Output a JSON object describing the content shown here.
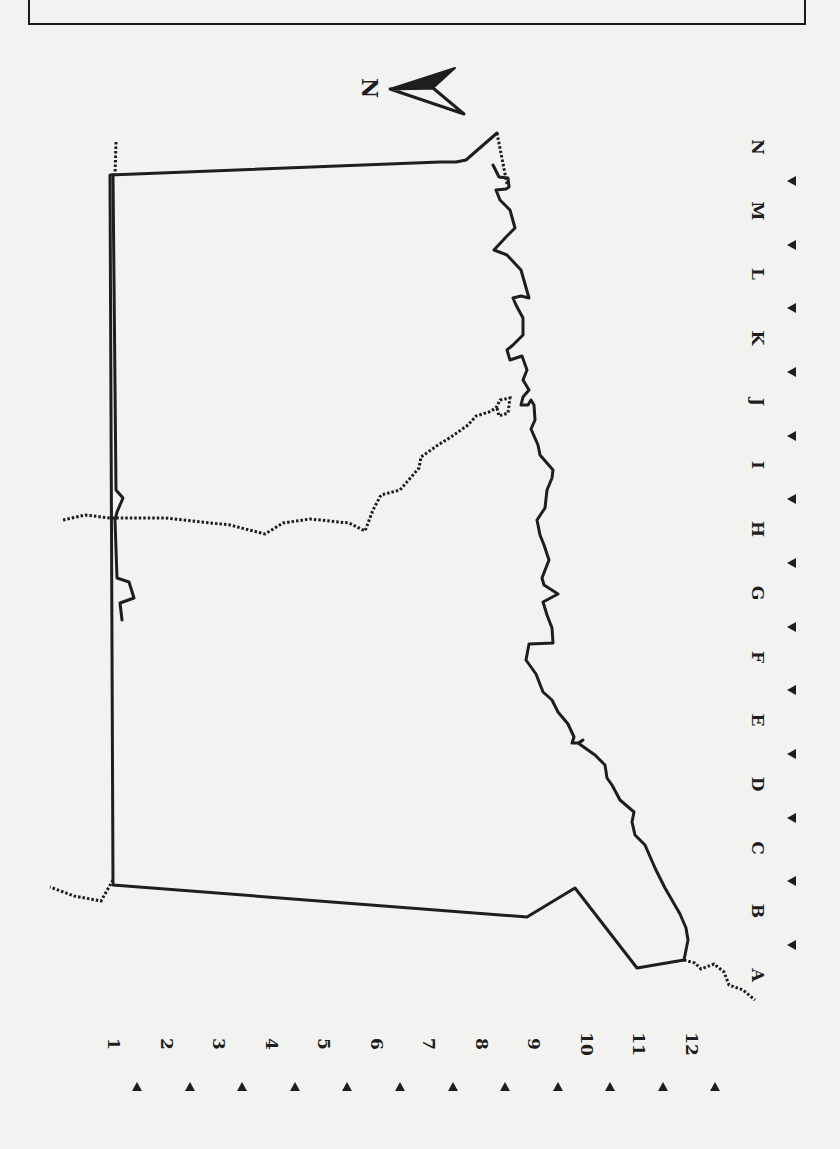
{
  "map": {
    "compass": {
      "label": "N",
      "icon": "north-arrow-icon"
    },
    "columns": [
      "N",
      "M",
      "L",
      "K",
      "J",
      "I",
      "H",
      "G",
      "F",
      "E",
      "D",
      "C",
      "B",
      "A"
    ],
    "rows": [
      "1",
      "2",
      "3",
      "4",
      "5",
      "6",
      "7",
      "8",
      "9",
      "10",
      "11",
      "12"
    ],
    "colors": {
      "ink": "#1e1e1e",
      "paper": "#f2f2f0"
    },
    "boundaries": {
      "solid_outline": [
        [
          497,
          133
        ],
        [
          466,
          160
        ],
        [
          456,
          162
        ],
        [
          440,
          162
        ],
        [
          110,
          175
        ],
        [
          113,
          885
        ],
        [
          527,
          917
        ],
        [
          575,
          888
        ],
        [
          637,
          968
        ],
        [
          684,
          960
        ],
        [
          688,
          940
        ],
        [
          686,
          928
        ],
        [
          680,
          914
        ],
        [
          665,
          888
        ],
        [
          655,
          868
        ],
        [
          645,
          845
        ],
        [
          635,
          835
        ],
        [
          632,
          822
        ],
        [
          634,
          812
        ],
        [
          620,
          800
        ],
        [
          612,
          785
        ],
        [
          607,
          778
        ],
        [
          605,
          765
        ],
        [
          595,
          755
        ],
        [
          578,
          743
        ],
        [
          583,
          740
        ],
        [
          579,
          743
        ],
        [
          572,
          743
        ],
        [
          574,
          737
        ],
        [
          568,
          724
        ],
        [
          558,
          712
        ],
        [
          552,
          700
        ],
        [
          543,
          692
        ],
        [
          536,
          674
        ],
        [
          526,
          660
        ],
        [
          529,
          644
        ],
        [
          553,
          643
        ],
        [
          552,
          628
        ],
        [
          547,
          615
        ],
        [
          543,
          602
        ],
        [
          558,
          594
        ],
        [
          544,
          585
        ],
        [
          542,
          578
        ],
        [
          549,
          560
        ],
        [
          544,
          545
        ],
        [
          540,
          535
        ],
        [
          537,
          520
        ],
        [
          545,
          508
        ],
        [
          547,
          490
        ],
        [
          552,
          478
        ],
        [
          553,
          470
        ],
        [
          540,
          455
        ],
        [
          538,
          445
        ],
        [
          531,
          429
        ],
        [
          535,
          420
        ],
        [
          534,
          405
        ],
        [
          531,
          400
        ],
        [
          528,
          405
        ],
        [
          521,
          405
        ],
        [
          523,
          397
        ],
        [
          529,
          390
        ],
        [
          523,
          380
        ],
        [
          527,
          370
        ],
        [
          522,
          356
        ],
        [
          510,
          360
        ],
        [
          507,
          350
        ],
        [
          513,
          345
        ],
        [
          523,
          335
        ],
        [
          523,
          318
        ],
        [
          516,
          305
        ],
        [
          513,
          298
        ],
        [
          521,
          296
        ],
        [
          529,
          298
        ],
        [
          521,
          270
        ],
        [
          507,
          255
        ],
        [
          494,
          250
        ],
        [
          506,
          237
        ],
        [
          515,
          228
        ],
        [
          510,
          210
        ],
        [
          500,
          200
        ],
        [
          496,
          190
        ],
        [
          506,
          189
        ],
        [
          509,
          187
        ],
        [
          508,
          178
        ],
        [
          499,
          177
        ],
        [
          493,
          165
        ]
      ],
      "north_inner_solid": [
        [
          113,
          885
        ],
        [
          113,
          175
        ]
      ],
      "dotted_segments": [
        [
          [
            116,
            142
          ],
          [
            115,
            175
          ]
        ],
        [
          [
            497,
            133
          ],
          [
            507,
            184
          ]
        ],
        [
          [
            113,
            880
          ],
          [
            101,
            901
          ],
          [
            74,
            896
          ],
          [
            50,
            887
          ]
        ],
        [
          [
            684,
            960
          ],
          [
            695,
            963
          ],
          [
            701,
            969
          ],
          [
            714,
            964
          ],
          [
            724,
            972
          ],
          [
            729,
            985
          ],
          [
            743,
            990
          ],
          [
            755,
            1000
          ]
        ],
        [
          [
            63,
            520
          ],
          [
            85,
            515
          ],
          [
            110,
            518
          ],
          [
            165,
            518
          ],
          [
            230,
            525
          ],
          [
            265,
            534
          ],
          [
            283,
            523
          ],
          [
            310,
            519
          ],
          [
            349,
            523
          ],
          [
            365,
            531
          ],
          [
            373,
            510
          ],
          [
            381,
            495
          ],
          [
            400,
            490
          ],
          [
            419,
            468
          ],
          [
            421,
            457
          ],
          [
            438,
            445
          ],
          [
            451,
            437
          ],
          [
            468,
            425
          ],
          [
            476,
            416
          ],
          [
            489,
            412
          ],
          [
            496,
            408
          ],
          [
            500,
            400
          ],
          [
            510,
            398
          ],
          [
            508,
            413
          ],
          [
            499,
            416
          ],
          [
            497,
            408
          ]
        ]
      ],
      "left_edge_jog": [
        [
          113,
          175
        ],
        [
          116,
          490
        ],
        [
          123,
          498
        ],
        [
          117,
          512
        ],
        [
          115,
          520
        ],
        [
          117,
          578
        ],
        [
          129,
          582
        ],
        [
          134,
          598
        ],
        [
          120,
          603
        ],
        [
          122,
          620
        ]
      ]
    }
  }
}
